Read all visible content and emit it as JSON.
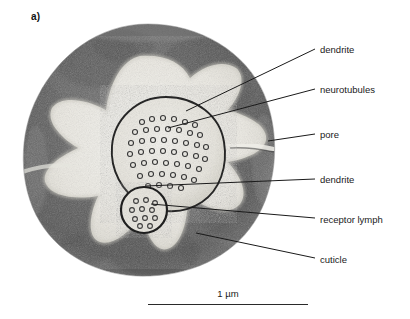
{
  "figure": {
    "panel_label": "a)",
    "kind": "electron-micrograph"
  },
  "annotations": [
    {
      "key": "dendrite-upper",
      "label": "dendrite",
      "text_x": 320,
      "text_y": 44,
      "line": {
        "x1": 315,
        "y1": 49,
        "x2": 186,
        "y2": 111
      }
    },
    {
      "key": "neurotubules",
      "label": "neurotubules",
      "text_x": 320,
      "text_y": 84,
      "line": {
        "x1": 315,
        "y1": 89,
        "x2": 168,
        "y2": 128
      }
    },
    {
      "key": "pore",
      "label": "pore",
      "text_x": 320,
      "text_y": 129,
      "line": {
        "x1": 315,
        "y1": 134,
        "x2": 268,
        "y2": 141
      }
    },
    {
      "key": "dendrite-lower",
      "label": "dendrite",
      "text_x": 320,
      "text_y": 174,
      "line": {
        "x1": 315,
        "y1": 179,
        "x2": 146,
        "y2": 186
      }
    },
    {
      "key": "receptor-lymph",
      "label": "receptor lymph",
      "text_x": 320,
      "text_y": 214,
      "line": {
        "x1": 315,
        "y1": 218,
        "x2": 151,
        "y2": 204
      }
    },
    {
      "key": "cuticle",
      "label": "cuticle",
      "text_x": 320,
      "text_y": 254,
      "line": {
        "x1": 315,
        "y1": 258,
        "x2": 196,
        "y2": 233
      }
    }
  ],
  "scale_bar": {
    "label": "1 µm",
    "length_px": 160
  },
  "colors": {
    "cuticle_dark": "#6f6f6f",
    "cuticle_darker": "#545454",
    "lymph_light": "#eeeeea",
    "outline": "#222222",
    "text": "#1a1a1a",
    "background": "#ffffff"
  },
  "structures": {
    "outer_cuticle": {
      "cx": 134,
      "cy": 130,
      "rx": 128,
      "ry": 126
    },
    "large_dendrite": {
      "cx": 152,
      "cy": 133,
      "r": 56,
      "neurotubule_count": 42
    },
    "small_dendrite": {
      "cx": 130,
      "cy": 190,
      "r": 24,
      "neurotubule_count": 11
    }
  }
}
